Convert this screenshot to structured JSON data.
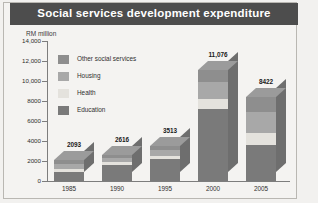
{
  "title": "Social services development expenditure",
  "axis_unit": "RM million",
  "source": "Source: various Economic Reports",
  "colors": {
    "banner": "#4d4d4d",
    "background": "#f4f3f1",
    "other_social_services": "#8e8e8e",
    "housing": "#a8a8a8",
    "health": "#e4e2dd",
    "education": "#7a7a7a",
    "axis": "#7d7d7d"
  },
  "legend": {
    "items": [
      {
        "label": "Other social services",
        "color": "#8e8e8e"
      },
      {
        "label": "Housing",
        "color": "#a8a8a8"
      },
      {
        "label": "Health",
        "color": "#e4e2dd"
      },
      {
        "label": "Education",
        "color": "#7a7a7a"
      }
    ]
  },
  "chart_data": {
    "type": "bar",
    "stacked": true,
    "title": "Social services development expenditure",
    "xlabel": "",
    "ylabel": "RM million",
    "ylim": [
      0,
      14000
    ],
    "grid": false,
    "legend_position": "inside-top-left",
    "categories": [
      "1985",
      "1990",
      "1995",
      "2000",
      "2005"
    ],
    "ytick_labels": [
      "14,000",
      "12,000",
      "10,000",
      "8000",
      "6000",
      "4000",
      "2000",
      "0"
    ],
    "ytick_values": [
      14000,
      12000,
      10000,
      8000,
      6000,
      4000,
      2000,
      0
    ],
    "totals": [
      2093,
      2616,
      3513,
      11076,
      8422
    ],
    "total_labels": [
      "2093",
      "2616",
      "3513",
      "11,076",
      "8422"
    ],
    "series": [
      {
        "name": "Education",
        "values": [
          900,
          1550,
          2200,
          7150,
          3600
        ]
      },
      {
        "name": "Health",
        "values": [
          280,
          330,
          310,
          1000,
          1150
        ]
      },
      {
        "name": "Housing",
        "values": [
          480,
          380,
          560,
          1700,
          2100
        ]
      },
      {
        "name": "Other social services",
        "values": [
          433,
          356,
          443,
          1226,
          1572
        ]
      }
    ]
  }
}
